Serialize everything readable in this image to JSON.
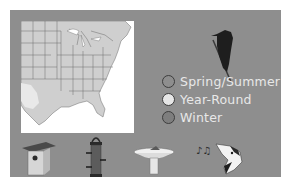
{
  "colors": {
    "panel_bg": "#8e8e8e",
    "map_land": "#cfcfcf",
    "map_water": "#ffffff",
    "legend_text": "#e8e8e8"
  },
  "map": {
    "region": "Eastern United States",
    "range_shading": "gray"
  },
  "legend": {
    "items": [
      {
        "label": "Spring/Summer",
        "swatch": "#8e8e8e"
      },
      {
        "label": "Year-Round",
        "swatch": "#e6e6e6"
      },
      {
        "label": "Winter",
        "swatch": "#7e7e7e"
      }
    ]
  },
  "icons": [
    {
      "name": "birdhouse-icon"
    },
    {
      "name": "tube-feeder-icon"
    },
    {
      "name": "birdbath-icon"
    },
    {
      "name": "bird-song-icon"
    }
  ],
  "bird_silhouette": "woodpecker-silhouette-icon"
}
